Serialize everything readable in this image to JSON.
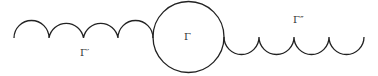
{
  "diagram": {
    "stroke_color": "#222222",
    "labels": {
      "left_chain": "Γ′",
      "center_circle": "Γ",
      "right_chain": "Γ″"
    },
    "left_chain": {
      "arc_count": 4,
      "orientation": "up"
    },
    "right_chain": {
      "arc_count": 4,
      "orientation": "down"
    }
  }
}
